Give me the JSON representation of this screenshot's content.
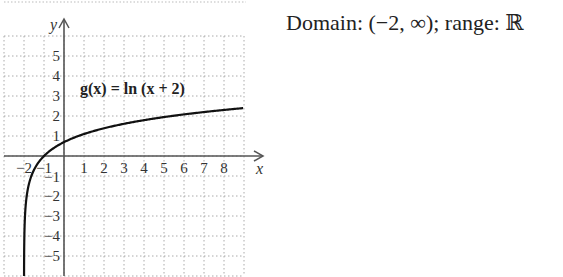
{
  "caption": {
    "text": "Domain: (−2, ∞); range: ℝ"
  },
  "chart_data": {
    "type": "line",
    "title": "",
    "function_label": "g(x) = ln (x + 2)",
    "xlabel": "x",
    "ylabel": "y",
    "xlim": [
      -3,
      9
    ],
    "ylim": [
      -6,
      6
    ],
    "grid": true,
    "grid_style": "dotted",
    "x_ticks": [
      -2,
      -1,
      1,
      2,
      3,
      4,
      5,
      6,
      7,
      8
    ],
    "x_tick_labels": [
      "−2",
      "−1",
      "1",
      "2",
      "3",
      "4",
      "5",
      "6",
      "7",
      "8"
    ],
    "y_ticks": [
      5,
      4,
      3,
      2,
      1,
      -1,
      -2,
      -3,
      -4,
      -5
    ],
    "y_tick_labels": [
      "5",
      "4",
      "3",
      "2",
      "1",
      "−1",
      "−2",
      "−3",
      "−4",
      "−5"
    ],
    "vertical_asymptote": -2,
    "series": [
      {
        "name": "g(x) = ln (x + 2)",
        "x": [
          -1.9975,
          -1.99,
          -1.95,
          -1.9,
          -1.8,
          -1.6,
          -1.4,
          -1.0,
          -0.5,
          0,
          1,
          2,
          3,
          4,
          5,
          6,
          7,
          8,
          9
        ],
        "y": [
          -6.0,
          -4.61,
          -3.0,
          -2.3,
          -1.61,
          -0.92,
          -0.51,
          0,
          0.41,
          0.69,
          1.1,
          1.39,
          1.61,
          1.79,
          1.95,
          2.08,
          2.2,
          2.3,
          2.4
        ]
      }
    ],
    "legend": []
  }
}
